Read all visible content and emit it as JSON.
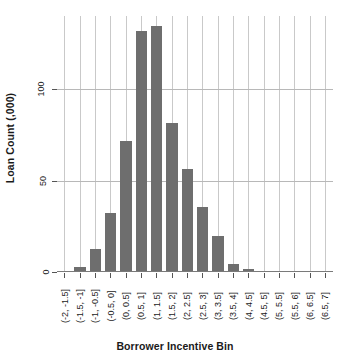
{
  "chart_data": {
    "type": "bar",
    "title": "",
    "xlabel": "Borrower Incentive Bin",
    "ylabel": "Loan Count (,000)",
    "categories": [
      "(-2, -1.5]",
      "(-1.5, -1]",
      "(-1, -0.5]",
      "(-0.5, 0]",
      "(0, 0.5]",
      "(0.5, 1]",
      "(1, 1.5]",
      "(1.5, 2]",
      "(2, 2.5]",
      "(2.5, 3]",
      "(3, 3.5]",
      "(3.5, 4]",
      "(4, 4.5]",
      "(4.5, 5]",
      "(5, 5.5]",
      "(5.5, 6]",
      "(6, 6.5]",
      "(6.5, 7]"
    ],
    "values": [
      0,
      2,
      12,
      32,
      71,
      131,
      134,
      81,
      56,
      35,
      19,
      4,
      1,
      0,
      0,
      0,
      0,
      0
    ],
    "ylim": [
      0,
      140
    ],
    "yticks": [
      0,
      50,
      100
    ],
    "ytick_labels": [
      "0",
      "50",
      "100"
    ],
    "grid": "both",
    "legend": "none",
    "bar_color": "#6e6e6e",
    "gridline_color": "#c9c9c9",
    "axis_color": "#555555",
    "background": "#ffffff"
  },
  "axis": {
    "y_title": "Loan Count (,000)",
    "x_title": "Borrower Incentive Bin"
  }
}
